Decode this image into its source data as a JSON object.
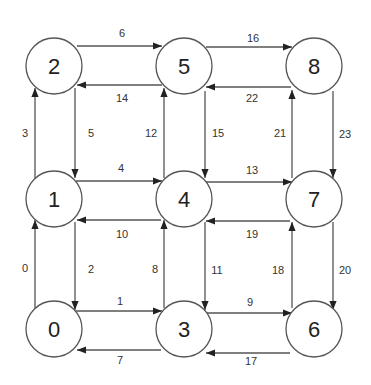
{
  "diagram": {
    "type": "directed-grid-graph",
    "nodes": [
      {
        "id": "0",
        "label": "0",
        "x": 54,
        "y": 329
      },
      {
        "id": "1",
        "label": "1",
        "x": 54,
        "y": 199
      },
      {
        "id": "2",
        "label": "2",
        "x": 54,
        "y": 66
      },
      {
        "id": "3",
        "label": "3",
        "x": 184,
        "y": 329
      },
      {
        "id": "4",
        "label": "4",
        "x": 184,
        "y": 199
      },
      {
        "id": "5",
        "label": "5",
        "x": 184,
        "y": 66
      },
      {
        "id": "6",
        "label": "6",
        "x": 314,
        "y": 329
      },
      {
        "id": "7",
        "label": "7",
        "x": 314,
        "y": 199
      },
      {
        "id": "8",
        "label": "8",
        "x": 314,
        "y": 66
      }
    ],
    "edges": [
      {
        "label": "0",
        "x1": 35,
        "y1": 308,
        "x2": 35,
        "y2": 220,
        "lx": 25,
        "ly": 268
      },
      {
        "label": "1",
        "x1": 76,
        "y1": 311,
        "x2": 162,
        "y2": 311,
        "lx": 120,
        "ly": 301
      },
      {
        "label": "2",
        "x1": 75,
        "y1": 222,
        "x2": 75,
        "y2": 310,
        "lx": 91,
        "ly": 269
      },
      {
        "label": "3",
        "x1": 35,
        "y1": 178,
        "x2": 35,
        "y2": 88,
        "lx": 25,
        "ly": 133
      },
      {
        "label": "4",
        "x1": 76,
        "y1": 181,
        "x2": 162,
        "y2": 181,
        "lx": 121,
        "ly": 168
      },
      {
        "label": "5",
        "x1": 75,
        "y1": 88,
        "x2": 75,
        "y2": 178,
        "lx": 91,
        "ly": 133
      },
      {
        "label": "6",
        "x1": 77,
        "y1": 46,
        "x2": 162,
        "y2": 46,
        "lx": 122,
        "ly": 33
      },
      {
        "label": "7",
        "x1": 161,
        "y1": 350,
        "x2": 77,
        "y2": 350,
        "lx": 120,
        "ly": 360
      },
      {
        "label": "8",
        "x1": 164,
        "y1": 308,
        "x2": 164,
        "y2": 220,
        "lx": 155,
        "ly": 269
      },
      {
        "label": "9",
        "x1": 206,
        "y1": 313,
        "x2": 292,
        "y2": 313,
        "lx": 250,
        "ly": 302
      },
      {
        "label": "10",
        "x1": 161,
        "y1": 220,
        "x2": 77,
        "y2": 220,
        "lx": 122,
        "ly": 234
      },
      {
        "label": "11",
        "x1": 205,
        "y1": 222,
        "x2": 205,
        "y2": 310,
        "lx": 217,
        "ly": 270
      },
      {
        "label": "12",
        "x1": 164,
        "y1": 178,
        "x2": 164,
        "y2": 88,
        "lx": 151,
        "ly": 133
      },
      {
        "label": "13",
        "x1": 206,
        "y1": 182,
        "x2": 292,
        "y2": 182,
        "lx": 252,
        "ly": 170
      },
      {
        "label": "14",
        "x1": 162,
        "y1": 85,
        "x2": 77,
        "y2": 85,
        "lx": 122,
        "ly": 98
      },
      {
        "label": "15",
        "x1": 205,
        "y1": 91,
        "x2": 205,
        "y2": 178,
        "lx": 218,
        "ly": 133
      },
      {
        "label": "16",
        "x1": 206,
        "y1": 47,
        "x2": 292,
        "y2": 47,
        "lx": 253,
        "ly": 38
      },
      {
        "label": "17",
        "x1": 290,
        "y1": 353,
        "x2": 206,
        "y2": 353,
        "lx": 251,
        "ly": 361
      },
      {
        "label": "18",
        "x1": 292,
        "y1": 308,
        "x2": 292,
        "y2": 222,
        "lx": 278,
        "ly": 270
      },
      {
        "label": "19",
        "x1": 290,
        "y1": 221,
        "x2": 206,
        "y2": 221,
        "lx": 252,
        "ly": 234
      },
      {
        "label": "20",
        "x1": 333,
        "y1": 222,
        "x2": 333,
        "y2": 310,
        "lx": 345,
        "ly": 270
      },
      {
        "label": "21",
        "x1": 292,
        "y1": 178,
        "x2": 292,
        "y2": 90,
        "lx": 280,
        "ly": 133
      },
      {
        "label": "22",
        "x1": 291,
        "y1": 87,
        "x2": 206,
        "y2": 87,
        "lx": 252,
        "ly": 98
      },
      {
        "label": "23",
        "x1": 333,
        "y1": 91,
        "x2": 333,
        "y2": 178,
        "lx": 345,
        "ly": 134
      }
    ]
  }
}
